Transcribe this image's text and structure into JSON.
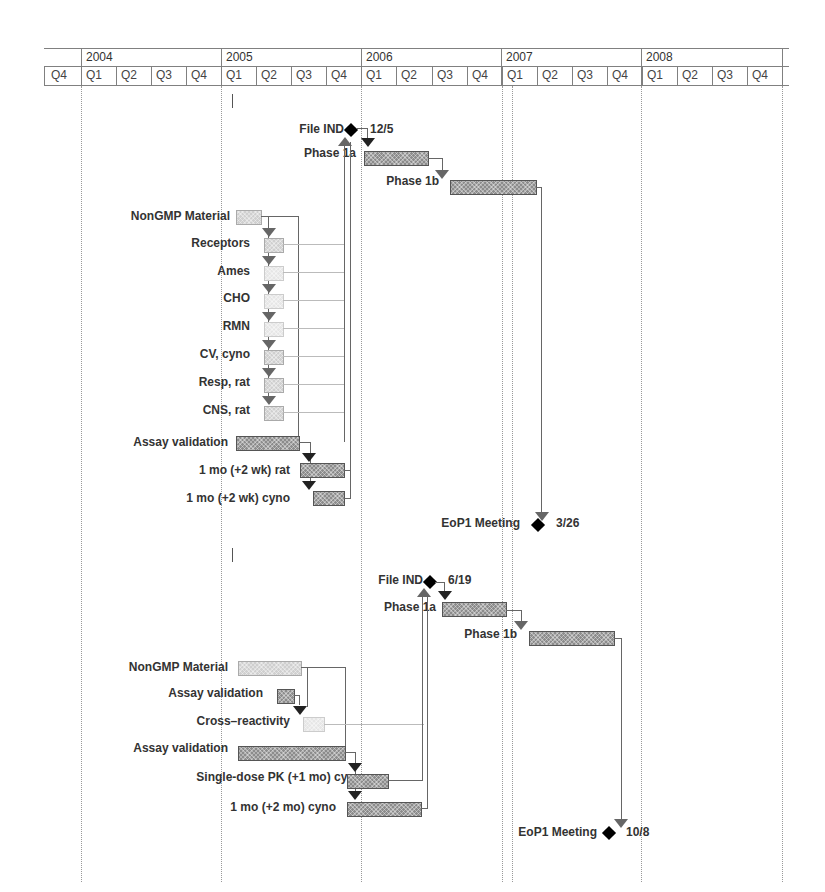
{
  "chart_data": {
    "type": "gantt",
    "title": "",
    "timescale": {
      "years": [
        "2004",
        "2005",
        "2006",
        "2007",
        "2008"
      ],
      "quarters": [
        "Q4",
        "Q1",
        "Q2",
        "Q3",
        "Q4",
        "Q1",
        "Q2",
        "Q3",
        "Q4",
        "Q1",
        "Q2",
        "Q3",
        "Q4",
        "Q1",
        "Q2",
        "Q3",
        "Q4",
        "Q1",
        "Q2",
        "Q3",
        "Q4"
      ]
    },
    "schedules": [
      {
        "tasks": [
          {
            "name": "File IND",
            "type": "milestone",
            "date": "12/5"
          },
          {
            "name": "Phase 1a",
            "type": "task",
            "start": "2006 Q1",
            "end": "2006 Q2"
          },
          {
            "name": "Phase 1b",
            "type": "task",
            "start": "2006 Q3",
            "end": "2007 Q1"
          },
          {
            "name": "NonGMP Material",
            "type": "task",
            "start": "2005 Q1",
            "end": "2005 Q1"
          },
          {
            "name": "Receptors",
            "type": "task",
            "start": "2005 Q2",
            "end": "2005 Q2"
          },
          {
            "name": "Ames",
            "type": "task",
            "start": "2005 Q2",
            "end": "2005 Q2"
          },
          {
            "name": "CHO",
            "type": "task",
            "start": "2005 Q2",
            "end": "2005 Q2"
          },
          {
            "name": "RMN",
            "type": "task",
            "start": "2005 Q2",
            "end": "2005 Q2"
          },
          {
            "name": "CV, cyno",
            "type": "task",
            "start": "2005 Q2",
            "end": "2005 Q2"
          },
          {
            "name": "Resp, rat",
            "type": "task",
            "start": "2005 Q2",
            "end": "2005 Q2"
          },
          {
            "name": "CNS, rat",
            "type": "task",
            "start": "2005 Q2",
            "end": "2005 Q2"
          },
          {
            "name": "Assay validation",
            "type": "task",
            "start": "2005 Q1",
            "end": "2005 Q3"
          },
          {
            "name": "1 mo (+2 wk) rat",
            "type": "task",
            "start": "2005 Q3",
            "end": "2005 Q4"
          },
          {
            "name": "1 mo (+2 wk) cyno",
            "type": "task",
            "start": "2005 Q3",
            "end": "2005 Q4"
          },
          {
            "name": "EoP1 Meeting",
            "type": "milestone",
            "date": "3/26"
          }
        ]
      },
      {
        "tasks": [
          {
            "name": "File IND",
            "type": "milestone",
            "date": "6/19"
          },
          {
            "name": "Phase 1a",
            "type": "task",
            "start": "2006 Q3",
            "end": "2006 Q4"
          },
          {
            "name": "Phase 1b",
            "type": "task",
            "start": "2007 Q1",
            "end": "2007 Q3"
          },
          {
            "name": "NonGMP Material",
            "type": "task",
            "start": "2005 Q1",
            "end": "2005 Q2"
          },
          {
            "name": "Assay validation",
            "type": "task",
            "start": "2005 Q2",
            "end": "2005 Q2"
          },
          {
            "name": "Cross-reactivity",
            "type": "task",
            "start": "2005 Q3",
            "end": "2005 Q3"
          },
          {
            "name": "Assay validation",
            "type": "task",
            "start": "2005 Q1",
            "end": "2005 Q4"
          },
          {
            "name": "Single-dose PK (+1 mo) cyno",
            "type": "task",
            "start": "2005 Q4",
            "end": "2006 Q1"
          },
          {
            "name": "1 mo (+2 mo) cyno",
            "type": "task",
            "start": "2005 Q4",
            "end": "2006 Q2"
          },
          {
            "name": "EoP1 Meeting",
            "type": "milestone",
            "date": "10/8"
          }
        ]
      }
    ]
  },
  "header": {
    "years": [
      "2004",
      "2005",
      "2006",
      "2007",
      "2008"
    ],
    "quarters": [
      "Q4",
      "Q1",
      "Q2",
      "Q3",
      "Q4",
      "Q1",
      "Q2",
      "Q3",
      "Q4",
      "Q1",
      "Q2",
      "Q3",
      "Q4",
      "Q1",
      "Q2",
      "Q3",
      "Q4",
      "Q1",
      "Q2",
      "Q3",
      "Q4"
    ]
  },
  "s1": {
    "file_ind": "File IND",
    "file_ind_date": "12/5",
    "phase1a": "Phase 1a",
    "phase1b": "Phase 1b",
    "nongmp": "NonGMP Material",
    "receptors": "Receptors",
    "ames": "Ames",
    "cho": "CHO",
    "rmn": "RMN",
    "cv": "CV, cyno",
    "resp": "Resp, rat",
    "cns": "CNS, rat",
    "assay": "Assay validation",
    "rat": "1 mo (+2 wk) rat",
    "cyno": "1 mo (+2 wk) cyno",
    "eop1": "EoP1 Meeting",
    "eop1_date": "3/26"
  },
  "s2": {
    "file_ind": "File IND",
    "file_ind_date": "6/19",
    "phase1a": "Phase 1a",
    "phase1b": "Phase 1b",
    "nongmp": "NonGMP Material",
    "assay_small": "Assay validation",
    "cross": "Cross–reactivity",
    "assay": "Assay validation",
    "pk": "Single-dose PK (+1 mo) cyno",
    "cyno": "1 mo (+2 mo) cyno",
    "eop1": "EoP1 Meeting",
    "eop1_date": "10/8"
  }
}
